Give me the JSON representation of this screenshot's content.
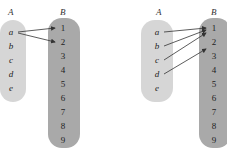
{
  "diagrams": [
    {
      "set_a_label": "A",
      "set_b_label": "B",
      "set_a": [
        "a",
        "b",
        "c",
        "d",
        "e"
      ],
      "set_b": [
        "1",
        "2",
        "3",
        "4",
        "5",
        "6",
        "7",
        "8",
        "9"
      ],
      "mappings": [
        [
          "a",
          "1"
        ],
        [
          "a",
          "2"
        ]
      ]
    },
    {
      "set_a_label": "A",
      "set_b_label": "B",
      "set_a": [
        "a",
        "b",
        "c",
        "d",
        "e"
      ],
      "set_b": [
        "1",
        "2",
        "3",
        "4",
        "5",
        "6",
        "7",
        "8",
        "9"
      ],
      "mappings": [
        [
          "a",
          "1"
        ],
        [
          "b",
          "1"
        ],
        [
          "c",
          "2"
        ],
        [
          "d",
          "3"
        ]
      ]
    }
  ],
  "colors": {
    "set_a_fill": "#d6d6d6",
    "set_b_fill": "#a9a9a9",
    "arrow": "#333333"
  }
}
